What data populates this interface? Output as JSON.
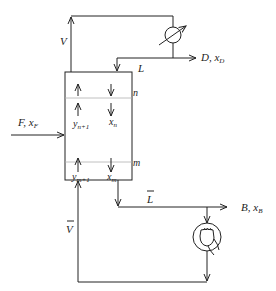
{
  "diagram": {
    "type": "distillation-column-schematic",
    "colors": {
      "line": "#222222",
      "stage_divider": "#b0b0b0",
      "background": "#ffffff"
    },
    "labels": {
      "vapor_top": "V",
      "reflux_liquid": "L",
      "distillate": "D, ",
      "distillate_comp": "x",
      "distillate_comp_sub": "D",
      "feed": "F, ",
      "feed_comp": "x",
      "feed_comp_sub": "F",
      "stage_n": "n",
      "stage_m": "m",
      "y_n1": "y",
      "y_n1_sub": "n+1",
      "x_n": "x",
      "x_n_sub": "n",
      "y_m1": "y",
      "y_m1_sub": "m+1",
      "x_m": "x",
      "x_m_sub": "m",
      "liquid_bottom": "L",
      "vapor_bottom": "V",
      "bottoms": "B, ",
      "bottoms_comp": "x",
      "bottoms_comp_sub": "B"
    },
    "components": [
      {
        "name": "column",
        "role": "distillation column"
      },
      {
        "name": "condenser",
        "role": "heat exchanger (top)"
      },
      {
        "name": "reboiler",
        "role": "reboiler (bottom)"
      }
    ]
  }
}
